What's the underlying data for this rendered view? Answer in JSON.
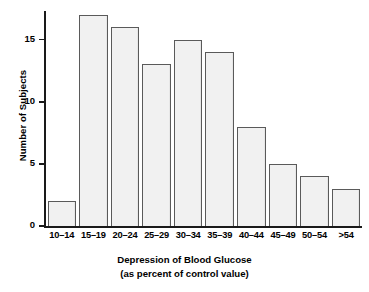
{
  "chart_data": {
    "type": "bar",
    "title": "",
    "subtitle": "",
    "xlabel": "Depression of Blood Glucose",
    "xlabel_line2": "(as percent of control value)",
    "ylabel": "Number of Subjects",
    "categories": [
      "10–14",
      "15–19",
      "20–24",
      "25–29",
      "30–34",
      "35–39",
      "40–44",
      "45–49",
      "50–54",
      ">54"
    ],
    "values": [
      2,
      17,
      16,
      13,
      15,
      14,
      8,
      5,
      4,
      3
    ],
    "ylim": [
      0,
      17.3
    ],
    "yticks": [
      0,
      5,
      10,
      15
    ],
    "ytick_labels": [
      "0",
      "5",
      "10",
      "15"
    ],
    "grid": false,
    "legend": false,
    "bar_fill_color": "#f1f1f1",
    "bar_edge_color": "#5a5a5a",
    "axis_color": "#1a1a1a"
  },
  "axes": {
    "y_title": "Number of Subjects",
    "x_title_line1": "Depression of Blood Glucose",
    "x_title_line2": "(as percent of control value)"
  }
}
